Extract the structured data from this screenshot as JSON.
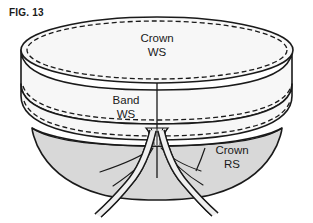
{
  "figure": {
    "label": "FIG. 13",
    "title": "FIG. 13",
    "background_color": "#ffffff",
    "line_color": "#1a1a1a",
    "white_fabric_color": "#f7f7f7",
    "gray_fabric_color": "#d8d8d8",
    "tie_fill_color": "#efefef"
  },
  "labels": {
    "crown_ws_line1": "Crown",
    "crown_ws_line2": "WS",
    "band_ws_line1": "Band",
    "band_ws_line2": "WS",
    "crown_rs_line1": "Crown",
    "crown_rs_line2": "RS"
  },
  "parts": {
    "crown_top_name": "crown-top-ellipse",
    "crown_side_name": "crown-side-wall",
    "band_name": "band-section",
    "bowl_name": "crown-right-side-bowl",
    "gather_name": "gathered-center",
    "ties_name": "fabric-ties"
  }
}
